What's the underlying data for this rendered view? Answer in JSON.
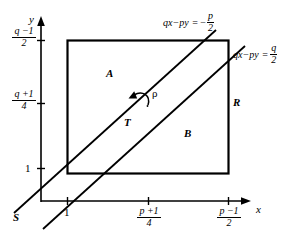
{
  "figure": {
    "type": "geometric-diagram",
    "axes": {
      "x_axis_label": "x",
      "y_axis_label": "y",
      "x_ticks": [
        {
          "label_type": "plain",
          "text": "1"
        },
        {
          "label_type": "fraction",
          "numerator": "p +1",
          "denominator": "4"
        },
        {
          "label_type": "fraction",
          "numerator": "p −1",
          "denominator": "2"
        }
      ],
      "y_ticks": [
        {
          "label_type": "fraction",
          "numerator": "q −1",
          "denominator": "2"
        },
        {
          "label_type": "fraction",
          "numerator": "q +1",
          "denominator": "4"
        },
        {
          "label_type": "plain",
          "text": "1"
        }
      ]
    },
    "lines": [
      {
        "name": "upper-line",
        "equation_lhs": "qx−py",
        "equation_rhs_sign": "−",
        "equation_rhs_numerator": "p",
        "equation_rhs_denominator": "2",
        "equation_full": "qx−py = − p/2"
      },
      {
        "name": "lower-line",
        "equation_lhs": "qx−py",
        "equation_rhs_sign": "",
        "equation_rhs_numerator": "q",
        "equation_rhs_denominator": "2",
        "equation_full": "qx−py = q/2"
      }
    ],
    "region_labels": [
      {
        "name": "region-a",
        "text": "A"
      },
      {
        "name": "region-b",
        "text": "B"
      },
      {
        "name": "strip-t",
        "text": "T"
      },
      {
        "name": "rectangle-r",
        "text": "R"
      },
      {
        "name": "point-s",
        "text": "S"
      }
    ],
    "annotations": [
      {
        "name": "rho-arrow-label",
        "text": "ρ"
      }
    ],
    "colors": {
      "stroke": "#000000",
      "background": "#ffffff"
    }
  }
}
